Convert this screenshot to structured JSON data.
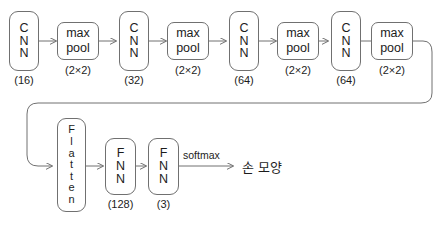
{
  "diagram": {
    "stroke_color": "#707070",
    "text_color": "#1c1c1c",
    "background_color": "#ffffff",
    "conv_blocks": [
      {
        "label": "CNN",
        "letters": [
          "C",
          "N",
          "N"
        ],
        "caption": "(16)"
      },
      {
        "label": "CNN",
        "letters": [
          "C",
          "N",
          "N"
        ],
        "caption": "(32)"
      },
      {
        "label": "CNN",
        "letters": [
          "C",
          "N",
          "N"
        ],
        "caption": "(64)"
      },
      {
        "label": "CNN",
        "letters": [
          "C",
          "N",
          "N"
        ],
        "caption": "(64)"
      }
    ],
    "pool_blocks": [
      {
        "line1": "max",
        "line2": "pool",
        "caption": "(2×2)"
      },
      {
        "line1": "max",
        "line2": "pool",
        "caption": "(2×2)"
      },
      {
        "line1": "max",
        "line2": "pool",
        "caption": "(2×2)"
      },
      {
        "line1": "max",
        "line2": "pool",
        "caption": "(2×2)"
      }
    ],
    "flatten_block": {
      "label": "Flatten",
      "letters": [
        "F",
        "l",
        "a",
        "t",
        "t",
        "e",
        "n"
      ]
    },
    "fnn_blocks": [
      {
        "label": "FNN",
        "letters": [
          "F",
          "N",
          "N"
        ],
        "caption": "(128)"
      },
      {
        "label": "FNN",
        "letters": [
          "F",
          "N",
          "N"
        ],
        "caption": "(3)"
      }
    ],
    "edge_labels": [
      {
        "text": "softmax"
      }
    ],
    "output": {
      "label": "손 모양"
    }
  }
}
